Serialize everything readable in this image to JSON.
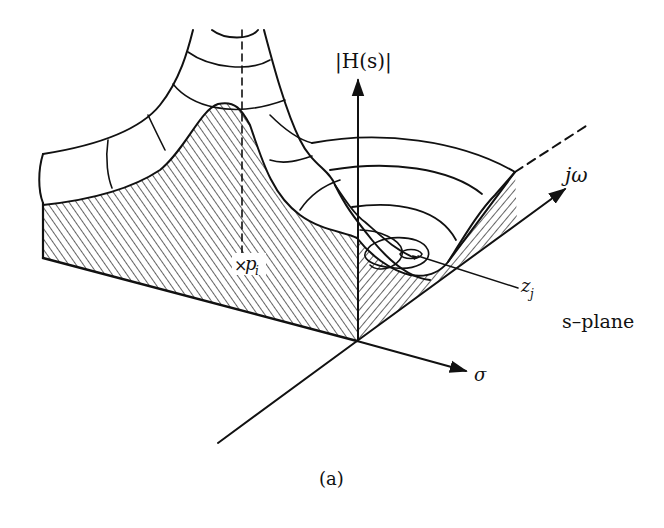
{
  "figure": {
    "caption": "(a)",
    "plane_label": "s–plane",
    "colors": {
      "ink": "#111111",
      "background": "#ffffff"
    }
  },
  "axes": {
    "magnitude": {
      "label": "|H(s)|"
    },
    "real": {
      "label": "σ"
    },
    "imaginary": {
      "label": "jω"
    }
  },
  "annotations": {
    "pole": {
      "symbol": "×",
      "label": "p",
      "subscript": "i"
    },
    "zero": {
      "label": "z",
      "subscript": "j"
    }
  }
}
